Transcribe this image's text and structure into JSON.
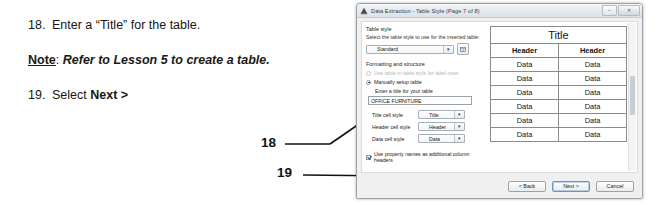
{
  "instructions": {
    "step18": {
      "number": "18.",
      "text": "Enter a “Title” for the table."
    },
    "note": {
      "label": "Note",
      "colon": ":",
      "text": "Refer to Lesson 5 to create a table."
    },
    "step19": {
      "number": "19.",
      "prefix": "Select ",
      "bold": "Next >"
    }
  },
  "callouts": {
    "a": "18",
    "b": "19"
  },
  "dialog": {
    "title": "Data Extraction - Table Style (Page 7 of 8)",
    "window_buttons": {
      "minimize": "–",
      "maximize": "□",
      "close": "✕"
    },
    "table_style": {
      "group_label": "Table style",
      "description": "Select the table style to use for the inserted table:",
      "selected": "Standard",
      "dropdown_arrow": "▾",
      "edit_button_icon": "table-style-editor-icon"
    },
    "formatting": {
      "section_label": "Formatting and structure",
      "option_use_table": "Use table in table style for label rows",
      "option_manual": "Manually setup table",
      "title_prompt": "Enter a title for your table",
      "title_value": "OFFICE FURNITURE",
      "fields": [
        {
          "label": "Title cell style",
          "value": "Title"
        },
        {
          "label": "Header cell style",
          "value": "Header"
        },
        {
          "label": "Data cell style",
          "value": "Data"
        }
      ],
      "checkbox_label": "Use property names as additional column headers"
    },
    "preview": {
      "title": "Title",
      "headers": [
        "Header",
        "Header"
      ],
      "rows": [
        [
          "Data",
          "Data"
        ],
        [
          "Data",
          "Data"
        ],
        [
          "Data",
          "Data"
        ],
        [
          "Data",
          "Data"
        ],
        [
          "Data",
          "Data"
        ],
        [
          "Data",
          "Data"
        ]
      ]
    },
    "buttons": {
      "back": "< Back",
      "next": "Next >",
      "cancel": "Cancel"
    }
  }
}
